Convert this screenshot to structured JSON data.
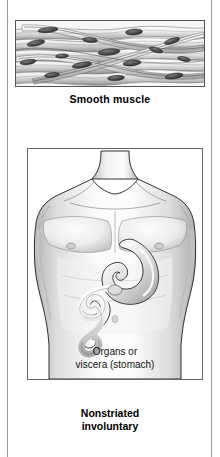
{
  "figure": {
    "panels": [
      {
        "id": "smooth-muscle-tissue",
        "kind": "histology-illustration",
        "caption": "Smooth muscle",
        "description": "Spindle-shaped smooth muscle cells with single central nuclei, arranged in interlacing sheets"
      },
      {
        "id": "torso-organs",
        "kind": "anatomy-illustration",
        "caption_line1": "Organs or",
        "caption_line2": "viscera (stomach)",
        "description": "Male torso showing stomach and duodenum in the abdomen"
      }
    ],
    "footer_line1": "Nonstriated",
    "footer_line2": "involuntary"
  },
  "colors": {
    "ink": "#000000",
    "frame": "#555555",
    "page_rule": "#9a9a9a",
    "tissue_light": "#f0f0f0",
    "tissue_mid": "#b9b9b9",
    "tissue_dark": "#4a4a4a",
    "skin_light": "#fbfbfb",
    "skin_mid": "#d8d8d8",
    "skin_shadow": "#a8a8a8",
    "organ_fill": "#e8e8e8"
  }
}
